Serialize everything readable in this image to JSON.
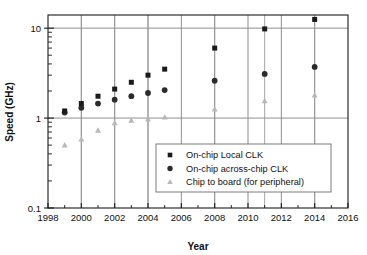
{
  "chart_data": {
    "type": "scatter",
    "title": "",
    "xlabel": "Year",
    "ylabel": "Speed (GHz)",
    "xlim": [
      1998,
      2016
    ],
    "ylim": [
      0.1,
      14
    ],
    "yscale": "log",
    "xscale": "linear",
    "grid": true,
    "xticks": [
      1998,
      2000,
      2002,
      2004,
      2006,
      2008,
      2010,
      2012,
      2014,
      2016
    ],
    "xtick_labels": [
      "1998",
      "2000",
      "2002",
      "2004",
      "2006",
      "2008",
      "2010",
      "2012",
      "2014",
      "2016"
    ],
    "yticks": [
      0.1,
      1,
      10
    ],
    "ytick_labels": [
      "0.1",
      "1",
      "10"
    ],
    "legend_position": "center-right",
    "series": [
      {
        "name": "On-chip Local CLK",
        "marker": "square",
        "color": "#1a1a1a",
        "points": [
          {
            "x": 1999,
            "y": 1.2
          },
          {
            "x": 2000,
            "y": 1.45
          },
          {
            "x": 2001,
            "y": 1.75
          },
          {
            "x": 2002,
            "y": 2.1
          },
          {
            "x": 2003,
            "y": 2.5
          },
          {
            "x": 2004,
            "y": 3.0
          },
          {
            "x": 2005,
            "y": 3.5
          },
          {
            "x": 2008,
            "y": 6.0
          },
          {
            "x": 2011,
            "y": 9.8
          },
          {
            "x": 2014,
            "y": 12.5
          }
        ]
      },
      {
        "name": "On-chip across-chip CLK",
        "marker": "circle",
        "color": "#2b2b2b",
        "points": [
          {
            "x": 1999,
            "y": 1.15
          },
          {
            "x": 2000,
            "y": 1.3
          },
          {
            "x": 2001,
            "y": 1.45
          },
          {
            "x": 2002,
            "y": 1.6
          },
          {
            "x": 2003,
            "y": 1.75
          },
          {
            "x": 2004,
            "y": 1.9
          },
          {
            "x": 2005,
            "y": 2.05
          },
          {
            "x": 2008,
            "y": 2.6
          },
          {
            "x": 2011,
            "y": 3.1
          },
          {
            "x": 2014,
            "y": 3.7
          }
        ]
      },
      {
        "name": "Chip to board (for peripheral)",
        "marker": "triangle",
        "color": "#b8b8b8",
        "points": [
          {
            "x": 1999,
            "y": 0.5
          },
          {
            "x": 2000,
            "y": 0.58
          },
          {
            "x": 2001,
            "y": 0.73
          },
          {
            "x": 2002,
            "y": 0.88
          },
          {
            "x": 2003,
            "y": 0.94
          },
          {
            "x": 2004,
            "y": 0.97
          },
          {
            "x": 2005,
            "y": 1.02
          },
          {
            "x": 2008,
            "y": 1.25
          },
          {
            "x": 2011,
            "y": 1.55
          },
          {
            "x": 2014,
            "y": 1.8
          }
        ]
      }
    ],
    "vertical_gridline_years": [
      2000,
      2002,
      2004,
      2006,
      2008,
      2010,
      2012,
      2014
    ],
    "marker_stem_years": [
      2000,
      2002,
      2004,
      2008,
      2011,
      2014
    ]
  },
  "legend": {
    "items": [
      {
        "label": "On-chip Local CLK",
        "marker": "square"
      },
      {
        "label": "On-chip across-chip CLK",
        "marker": "circle"
      },
      {
        "label": "Chip to board (for peripheral)",
        "marker": "triangle"
      }
    ]
  },
  "axes": {
    "x_title": "Year",
    "y_title": "Speed (GHz)"
  },
  "colors": {
    "series_square": "#1a1a1a",
    "series_circle": "#2b2b2b",
    "series_triangle": "#b8b8b8",
    "grid": "#8f8f8f",
    "axis": "#1a1a1a",
    "background": "#ffffff"
  }
}
